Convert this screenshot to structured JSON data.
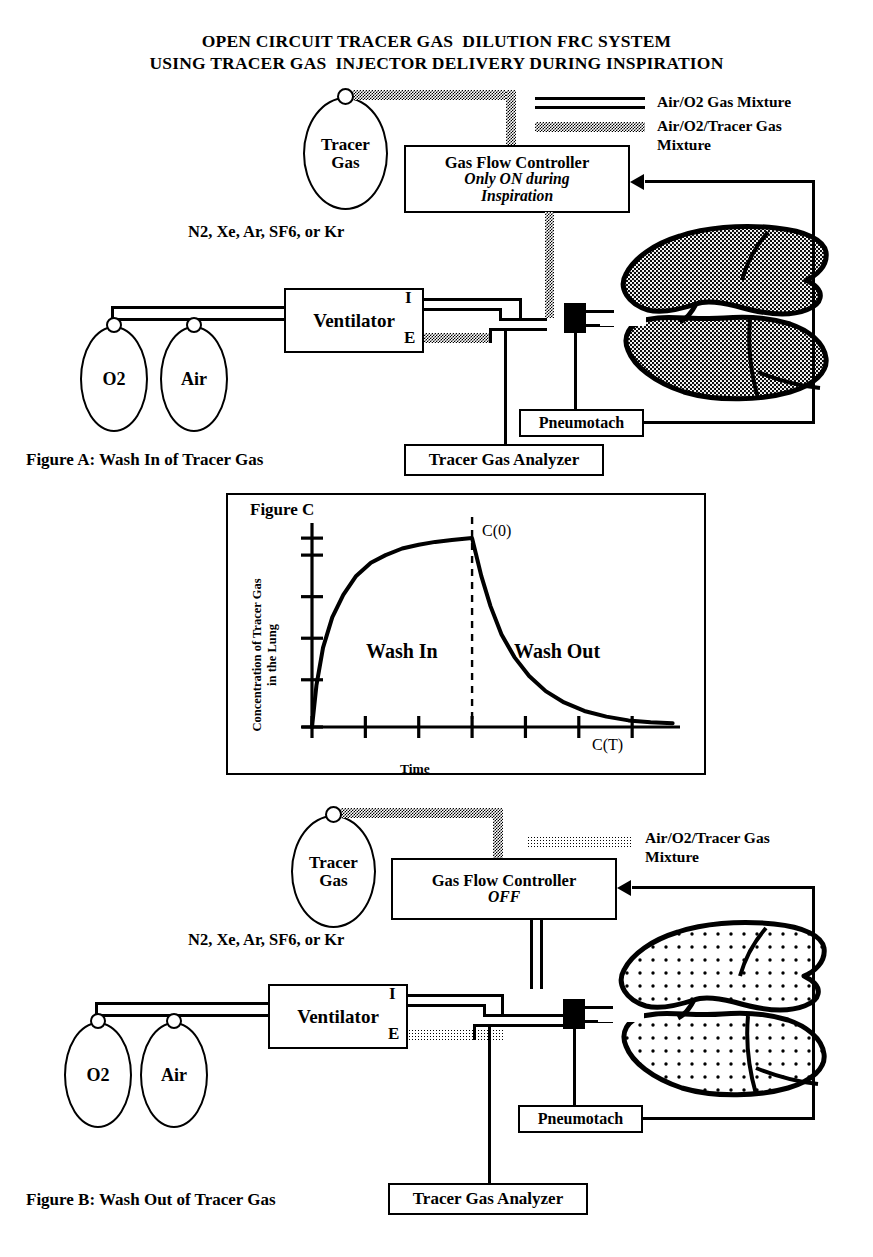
{
  "title": {
    "line1": "OPEN CIRCUIT TRACER GAS  DILUTION FRC SYSTEM",
    "line2": "USING TRACER GAS  INJECTOR DELIVERY DURING INSPIRATION"
  },
  "legend_a": {
    "item1_label": "Air/O2 Gas Mixture",
    "item2_label": "Air/O2/Tracer Gas\nMixture"
  },
  "legend_b": {
    "item1_label": "Air/O2/Tracer Gas\nMixture"
  },
  "figure_a": {
    "caption": "Figure A: Wash In of Tracer Gas",
    "tracer_cylinder_label": "Tracer\nGas",
    "tracer_gases_note": "N2, Xe, Ar, SF6, or Kr",
    "gas_flow_controller": {
      "title": "Gas Flow Controller",
      "state": "Only ON during\nInspiration"
    },
    "ventilator_label": "Ventilator",
    "port_inspiratory": "I",
    "port_expiratory": "E",
    "o2_cylinder_label": "O2",
    "air_cylinder_label": "Air",
    "pneumotach_label": "Pneumotach",
    "analyzer_label": "Tracer Gas Analyzer"
  },
  "figure_b": {
    "caption": "Figure B: Wash Out of Tracer Gas",
    "tracer_cylinder_label": "Tracer\nGas",
    "tracer_gases_note": "N2, Xe, Ar, SF6, or Kr",
    "gas_flow_controller": {
      "title": "Gas Flow Controller",
      "state": "OFF"
    },
    "ventilator_label": "Ventilator",
    "port_inspiratory": "I",
    "port_expiratory": "E",
    "o2_cylinder_label": "O2",
    "air_cylinder_label": "Air",
    "pneumotach_label": "Pneumotach",
    "analyzer_label": "Tracer Gas Analyzer"
  },
  "figure_c": {
    "panel_title": "Figure C",
    "wash_in_label": "Wash In",
    "wash_out_label": "Wash Out",
    "c0_label": "C(0)",
    "ct_label": "C(T)"
  },
  "chart_data": {
    "type": "line",
    "title": "Figure C",
    "xlabel": "Time",
    "ylabel": "Concentration of Tracer Gas in the Lung",
    "xlim": [
      0,
      10
    ],
    "ylim": [
      0,
      1.08
    ],
    "grid": false,
    "legend": "none",
    "x_ticks": [
      0,
      1.45,
      2.9,
      4.35,
      5.8,
      7.25,
      8.7
    ],
    "y_ticks": [
      0,
      0.25,
      0.47,
      0.69,
      0.91,
      1.0
    ],
    "annotations": [
      {
        "text": "C(0)",
        "x": 4.35,
        "y": 1.0
      },
      {
        "text": "C(T)",
        "x": 8.2,
        "y": 0.07
      },
      {
        "text": "Wash In",
        "x": 2.2,
        "y": 0.45
      },
      {
        "text": "Wash Out",
        "x": 6.4,
        "y": 0.45
      }
    ],
    "marker_line": {
      "x": 4.35,
      "style": "dashed",
      "label": "C(0)"
    },
    "series": [
      {
        "name": "Tracer gas concentration",
        "phase_split_x": 4.35,
        "x": [
          0.0,
          0.12,
          0.3,
          0.55,
          0.85,
          1.2,
          1.6,
          2.0,
          2.45,
          2.9,
          3.35,
          3.8,
          4.35,
          4.45,
          4.6,
          4.85,
          5.15,
          5.5,
          5.9,
          6.35,
          6.85,
          7.4,
          8.0,
          8.6,
          9.2,
          9.8
        ],
        "y": [
          0.0,
          0.22,
          0.42,
          0.58,
          0.7,
          0.8,
          0.87,
          0.91,
          0.945,
          0.965,
          0.98,
          0.99,
          1.0,
          0.92,
          0.8,
          0.64,
          0.49,
          0.37,
          0.27,
          0.19,
          0.13,
          0.085,
          0.055,
          0.035,
          0.025,
          0.02
        ]
      }
    ]
  }
}
